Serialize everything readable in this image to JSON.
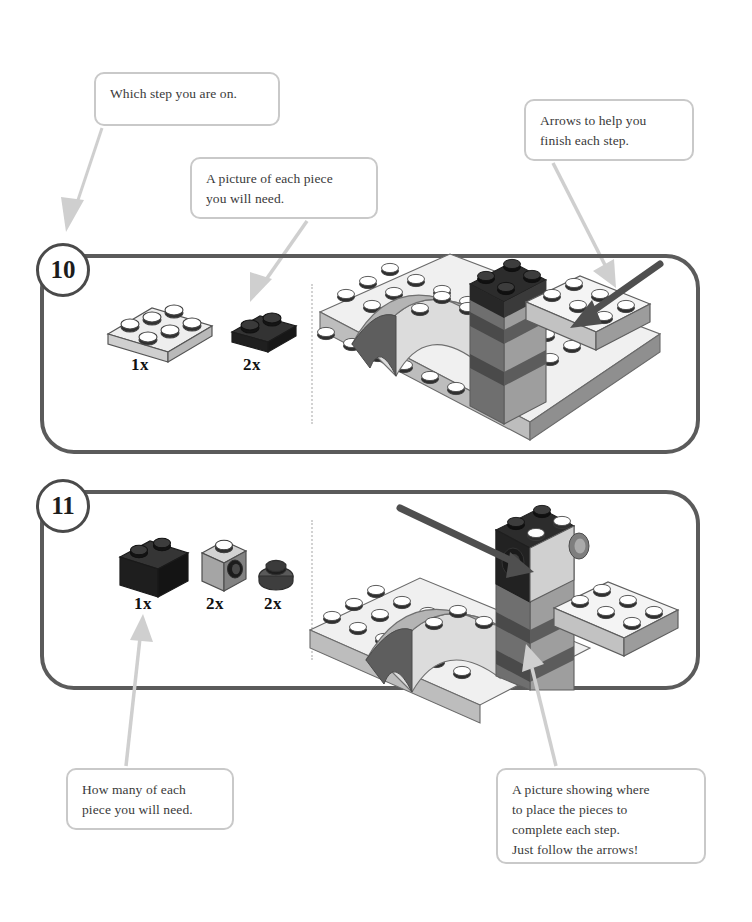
{
  "document": {
    "type": "lego-instruction-guide-annotated",
    "background": "#ffffff"
  },
  "colors": {
    "panel_border": "#5b5b5b",
    "badge_border": "#4a4a4a",
    "callout_border": "#c9c9c9",
    "leader_arrow": "#cccccc",
    "build_arrow": "#4f4f4f",
    "text": "#3a3a3a",
    "brick_dark": "#2b2b2b",
    "brick_light": "#e8e8e8",
    "brick_gray": "#9a9a9a",
    "brick_midgray": "#7d7d7d",
    "divider_dots": "#d2d2d2"
  },
  "callouts": [
    {
      "id": "which-step",
      "lines": [
        "Which step you are on."
      ],
      "points_to": "step-10-badge"
    },
    {
      "id": "piece-picture",
      "lines": [
        "A picture of each piece",
        "you will need."
      ],
      "points_to": "step-10-part-2"
    },
    {
      "id": "arrows-help",
      "lines": [
        "Arrows to help you",
        "finish each step."
      ],
      "points_to": "step-10-build-arrow"
    },
    {
      "id": "how-many",
      "lines": [
        "How many of each",
        "piece you will need."
      ],
      "points_to": "step-11-quantity-label"
    },
    {
      "id": "placement-picture",
      "lines": [
        "A picture showing where",
        "to place the pieces to",
        "complete each step.",
        "Just follow the arrows!"
      ],
      "points_to": "step-11-build-scene"
    }
  ],
  "steps": [
    {
      "number": "10",
      "parts": [
        {
          "name": "plate-2x3-light",
          "quantity": "1x",
          "color": "#e9e9e9",
          "studs": 6
        },
        {
          "name": "plate-1x2-dark",
          "quantity": "2x",
          "color": "#2b2b2b",
          "studs": 2
        }
      ],
      "build_arrow": {
        "direction": "down-left",
        "color": "#4f4f4f"
      }
    },
    {
      "number": "11",
      "parts": [
        {
          "name": "brick-1x2-dark",
          "quantity": "1x",
          "color": "#2b2b2b",
          "studs": 2
        },
        {
          "name": "brick-1x1-snot-gray",
          "quantity": "2x",
          "color": "#9a9a9a",
          "studs": 1
        },
        {
          "name": "round-plate-1x1-dark",
          "quantity": "2x",
          "color": "#4a4a4a",
          "studs": 1
        }
      ],
      "build_arrow": {
        "direction": "down-right",
        "color": "#4f4f4f"
      }
    }
  ]
}
